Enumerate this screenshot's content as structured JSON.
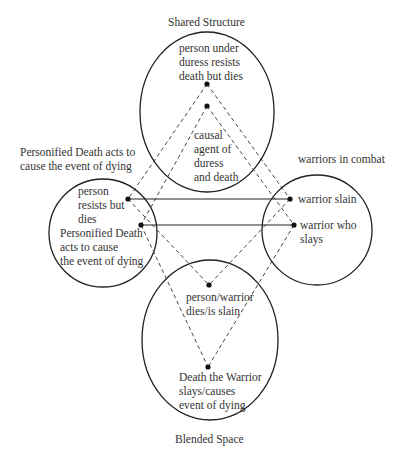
{
  "labels": {
    "shared_title": "Shared Structure",
    "left_title_line1": "Personified Death acts to",
    "left_title_line2": "cause the event of dying",
    "right_title": "warriors in combat",
    "bottom_title": "Blended Space"
  },
  "top_space": {
    "item1": [
      "person under",
      "duress resists",
      "death but dies"
    ],
    "item2": [
      "causal",
      "agent of",
      "duress",
      "and death"
    ]
  },
  "left_space": {
    "item1": [
      "person",
      "resists but",
      "dies"
    ],
    "item2": [
      "Personified Death",
      "acts to cause",
      "the event of dying"
    ]
  },
  "right_space": {
    "item1": [
      "warrior slain"
    ],
    "item2": [
      "warrior who",
      "slays"
    ]
  },
  "bottom_space": {
    "item1": [
      "person/warrior",
      "dies/is slain"
    ],
    "item2": [
      "Death the Warrior",
      "slays/causes",
      "event of dying"
    ]
  },
  "colors": {
    "stroke": "#222222",
    "text": "#333333"
  }
}
